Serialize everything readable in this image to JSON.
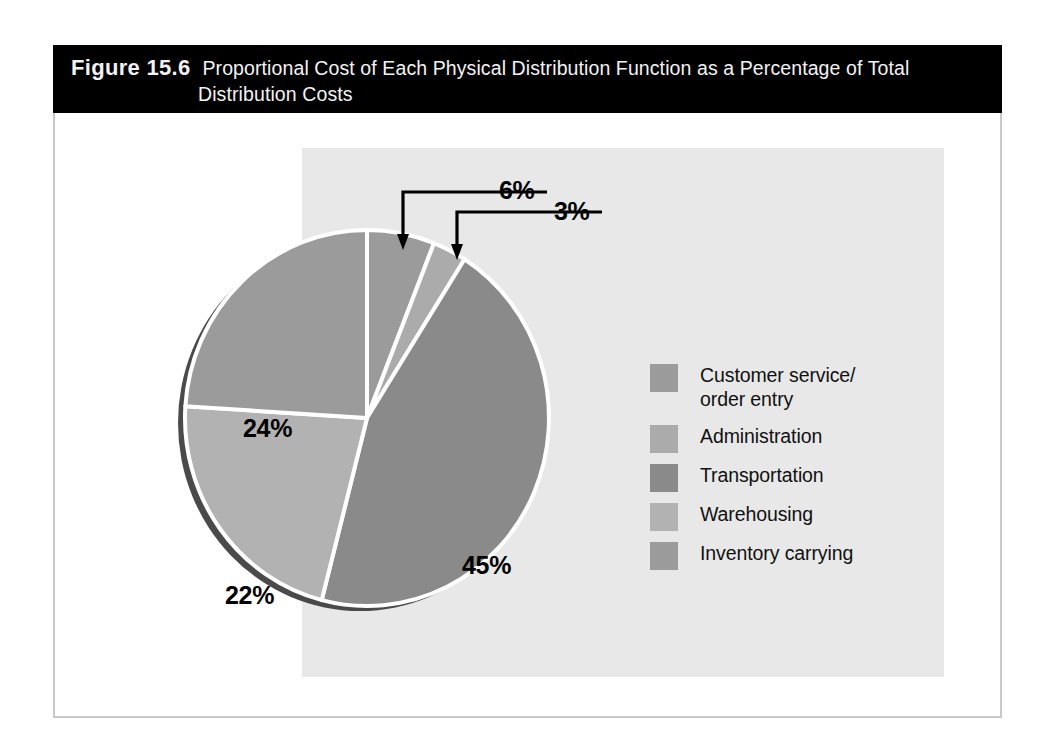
{
  "figure": {
    "number_label": "Figure 15.6",
    "title_line1": "Proportional Cost of Each Physical Distribution Function as a Percentage of Total",
    "title_line2": "Distribution Costs"
  },
  "colors": {
    "title_bar_bg": "#000000",
    "title_text": "#f2f2f2",
    "panel_bg": "#e8e8e8",
    "frame_border": "#c9c9c9",
    "page_bg": "#ffffff",
    "slice_separator": "#ffffff",
    "pie_shadow": "#4a4a4a",
    "label_text": "#000000",
    "callout_line": "#000000"
  },
  "chart_data": {
    "type": "pie",
    "title": "Proportional Cost of Each Physical Distribution Function as a Percentage of Total Distribution Costs",
    "xlabel": "",
    "ylabel": "",
    "legend_position": "right",
    "grid": false,
    "unit": "%",
    "categories": [
      "Customer service/ order entry",
      "Administration",
      "Transportation",
      "Warehousing",
      "Inventory carrying"
    ],
    "values": [
      6,
      3,
      45,
      22,
      24
    ],
    "slices": [
      {
        "label": "Customer service/\norder entry",
        "legend_label_line1": "Customer service/",
        "legend_label_line2": "order entry",
        "value": 6,
        "value_text": "6%",
        "color": "#9b9b9b",
        "label_style": "callout",
        "start_angle_deg": 0,
        "end_angle_deg": 21.6
      },
      {
        "label": "Administration",
        "legend_label_line1": "Administration",
        "legend_label_line2": "",
        "value": 3,
        "value_text": "3%",
        "color": "#ababab",
        "label_style": "callout",
        "start_angle_deg": 21.6,
        "end_angle_deg": 32.4
      },
      {
        "label": "Transportation",
        "legend_label_line1": "Transportation",
        "legend_label_line2": "",
        "value": 45,
        "value_text": "45%",
        "color": "#8a8a8a",
        "label_style": "inside",
        "start_angle_deg": 32.4,
        "end_angle_deg": 194.4
      },
      {
        "label": "Warehousing",
        "legend_label_line1": "Warehousing",
        "legend_label_line2": "",
        "value": 22,
        "value_text": "22%",
        "color": "#b2b2b2",
        "label_style": "inside",
        "start_angle_deg": 194.4,
        "end_angle_deg": 273.6
      },
      {
        "label": "Inventory carrying",
        "legend_label_line1": "Inventory carrying",
        "legend_label_line2": "",
        "value": 24,
        "value_text": "24%",
        "color": "#9b9b9b",
        "label_style": "inside",
        "start_angle_deg": 273.6,
        "end_angle_deg": 360
      }
    ],
    "callouts": [
      {
        "value_text": "6%",
        "points_to_slice": "Customer service/ order entry"
      },
      {
        "value_text": "3%",
        "points_to_slice": "Administration"
      }
    ]
  }
}
